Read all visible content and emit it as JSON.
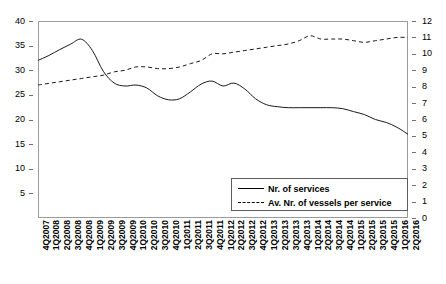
{
  "chart_data": {
    "type": "line",
    "title": "",
    "xlabel": "",
    "ylabel": "",
    "grid": false,
    "legend_position": "inside-bottom-right",
    "categories": [
      "4Q2007",
      "1Q2008",
      "2Q2008",
      "3Q2008",
      "4Q2008",
      "1Q2009",
      "2Q2009",
      "3Q2009",
      "4Q2009",
      "1Q2010",
      "2Q2010",
      "3Q2010",
      "4Q2010",
      "1Q2011",
      "2Q2011",
      "3Q2011",
      "4Q2011",
      "1Q2012",
      "2Q2012",
      "3Q2012",
      "4Q2012",
      "1Q2013",
      "2Q2013",
      "3Q2013",
      "4Q2013",
      "1Q2014",
      "2Q2014",
      "3Q2014",
      "4Q2014",
      "1Q2015",
      "2Q2015",
      "3Q2015",
      "4Q2015",
      "1Q2016",
      "2Q2016"
    ],
    "axes": {
      "left": {
        "label": "",
        "min": 0,
        "max": 40,
        "ticks": [
          5,
          10,
          15,
          20,
          25,
          30,
          35,
          40
        ],
        "series": "Nr. of services"
      },
      "right": {
        "label": "",
        "min": 0,
        "max": 12,
        "ticks": [
          0,
          1,
          2,
          3,
          4,
          5,
          6,
          7,
          8,
          9,
          10,
          11,
          12
        ],
        "series": "Av. Nr. of vessels per service"
      }
    },
    "series": [
      {
        "name": "Nr. of services",
        "style": "solid",
        "axis": "left",
        "color": "#1a1a1a",
        "values": [
          32.0,
          33.0,
          34.2,
          35.3,
          36.3,
          34.0,
          29.8,
          27.4,
          26.8,
          27.0,
          26.4,
          24.8,
          24.0,
          24.2,
          25.6,
          27.2,
          27.8,
          26.8,
          27.4,
          26.2,
          24.2,
          23.0,
          22.6,
          22.4,
          22.4,
          22.4,
          22.4,
          22.4,
          22.2,
          21.6,
          21.0,
          20.0,
          19.4,
          18.4,
          17.0
        ]
      },
      {
        "name": "Av. Nr. of vessels per service",
        "style": "dashed",
        "axis": "right",
        "color": "#1a1a1a",
        "values": [
          8.1,
          8.2,
          8.3,
          8.4,
          8.5,
          8.6,
          8.7,
          8.9,
          9.0,
          9.2,
          9.2,
          9.1,
          9.1,
          9.2,
          9.4,
          9.6,
          10.0,
          10.0,
          10.1,
          10.2,
          10.3,
          10.4,
          10.5,
          10.6,
          10.8,
          11.1,
          10.9,
          10.9,
          10.9,
          10.8,
          10.7,
          10.8,
          10.9,
          11.0,
          11.0
        ]
      }
    ]
  },
  "legend": {
    "items": [
      {
        "label": "Nr. of services",
        "style": "solid"
      },
      {
        "label": "Av. Nr. of vessels per service",
        "style": "dashed"
      }
    ]
  }
}
